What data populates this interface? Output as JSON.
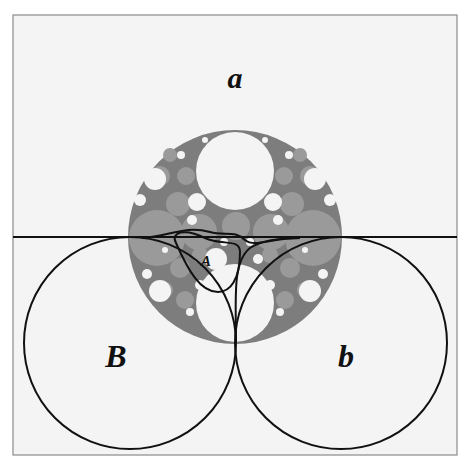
{
  "figure": {
    "labels": {
      "a": "a",
      "A": "A",
      "B": "B",
      "b": "b"
    },
    "colors": {
      "background": "#f4f4f4",
      "frame": "#8a8a8a",
      "disk_gray": "#8f8f8f",
      "packing_gray": "#a8a8a8",
      "white_circle": "#f4f4f4",
      "curve": "#111111"
    }
  }
}
